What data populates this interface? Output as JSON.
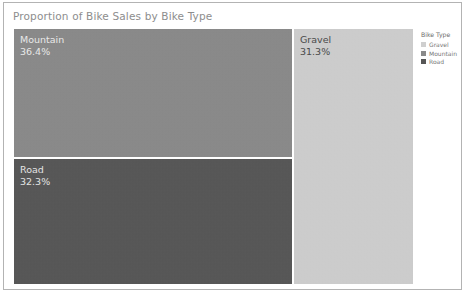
{
  "chart_data": {
    "type": "treemap",
    "title": "Proportion of Bike Sales by Bike Type",
    "categories": [
      "Mountain",
      "Road",
      "Gravel"
    ],
    "values": [
      36.4,
      32.3,
      31.3
    ],
    "value_labels": [
      "36.4%",
      "32.3%",
      "31.3%"
    ],
    "xlabel": "",
    "ylabel": "",
    "grid": false,
    "legend_position": "right",
    "tiles": [
      {
        "label": "Mountain",
        "value": 36.4,
        "value_label": "36.4%",
        "color": "#8a8a8a",
        "text_color": "#e8e8e8"
      },
      {
        "label": "Road",
        "value": 32.3,
        "value_label": "32.3%",
        "color": "#565656",
        "text_color": "#e3e3e3"
      },
      {
        "label": "Gravel",
        "value": 31.3,
        "value_label": "31.3%",
        "color": "#cfcfcf",
        "text_color": "#4a4a4a"
      }
    ],
    "legend": {
      "title": "Bike Type",
      "entries": [
        {
          "label": "Gravel",
          "color": "#cfcfcf"
        },
        {
          "label": "Mountain",
          "color": "#8a8a8a"
        },
        {
          "label": "Road",
          "color": "#565656"
        }
      ]
    }
  },
  "colors": {
    "border": "#b3b3b3",
    "background": "#ffffff",
    "title_text": "#8d8d8d",
    "legend_text": "#777777",
    "gravel": "#cfcfcf",
    "mountain": "#8a8a8a",
    "road": "#565656"
  }
}
